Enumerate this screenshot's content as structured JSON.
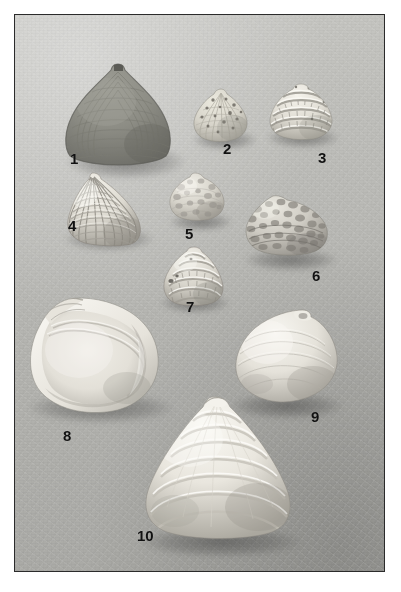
{
  "plate": {
    "kind": "photographic-plate",
    "subject": "bivalve mollusc shells",
    "background_color": "#b8b8b4",
    "frame_color": "#2b2b2b",
    "page_color": "#ffffff",
    "specimen_count": 10,
    "frame": {
      "left": 14,
      "top": 14,
      "width": 371,
      "height": 558
    }
  },
  "specimens": [
    {
      "number": "1",
      "label_x": 69,
      "label_y": 150,
      "x": 61,
      "y": 61,
      "w": 112,
      "h": 104,
      "shape": "trigonal-venerid",
      "tone": "#8f8f88",
      "highlight": "#a8a8a0",
      "shadow_tone": "#6d6d67",
      "sculpture": "concentric-growth-rings",
      "view": "exterior-right-valve"
    },
    {
      "number": "2",
      "label_x": 222,
      "label_y": 140,
      "x": 190,
      "y": 87,
      "w": 59,
      "h": 54,
      "shape": "rounded-trigonal",
      "tone": "#d3d0c8",
      "highlight": "#e8e6df",
      "shadow_tone": "#9d9a92",
      "sculpture": "radial-ribs-with-dark-spots",
      "view": "exterior"
    },
    {
      "number": "3",
      "label_x": 317,
      "label_y": 149,
      "x": 266,
      "y": 82,
      "w": 67,
      "h": 57,
      "shape": "rounded-lamellate",
      "tone": "#dedbd2",
      "highlight": "#f2f0e9",
      "shadow_tone": "#9a978f",
      "sculpture": "strong-concentric-lamellae",
      "view": "exterior"
    },
    {
      "number": "4",
      "label_x": 67,
      "label_y": 217,
      "x": 62,
      "y": 170,
      "w": 82,
      "h": 76,
      "shape": "trigonal-cardiid",
      "tone": "#d8d5cd",
      "highlight": "#efede6",
      "shadow_tone": "#8e8b84",
      "sculpture": "reticulate-cross-hatched-ribs",
      "view": "exterior"
    },
    {
      "number": "5",
      "label_x": 184,
      "label_y": 225,
      "x": 167,
      "y": 171,
      "w": 58,
      "h": 50,
      "shape": "rounded-ovate",
      "tone": "#d5d2ca",
      "highlight": "#eceae3",
      "shadow_tone": "#93908a",
      "sculpture": "mottled-granular",
      "view": "exterior"
    },
    {
      "number": "6",
      "label_x": 311,
      "label_y": 267,
      "x": 242,
      "y": 192,
      "w": 87,
      "h": 64,
      "shape": "elongate-ovate",
      "tone": "#cbc8c0",
      "highlight": "#e6e4dd",
      "shadow_tone": "#85827c",
      "sculpture": "heavily-blotched-mottled",
      "view": "exterior"
    },
    {
      "number": "7",
      "label_x": 185,
      "label_y": 298,
      "x": 160,
      "y": 245,
      "w": 65,
      "h": 61,
      "shape": "conical-trigonal",
      "tone": "#d6d3cb",
      "highlight": "#efede6",
      "shadow_tone": "#8b8882",
      "sculpture": "concentric-beaded-ridges",
      "view": "exterior"
    },
    {
      "number": "8",
      "label_x": 62,
      "label_y": 427,
      "x": 26,
      "y": 295,
      "w": 135,
      "h": 117,
      "shape": "broad-ovate",
      "tone": "#e9e7e0",
      "highlight": "#faf9f5",
      "shadow_tone": "#9a978f",
      "sculpture": "smooth-with-pallial-line",
      "view": "interior-left-valve"
    },
    {
      "number": "9",
      "label_x": 310,
      "label_y": 408,
      "x": 232,
      "y": 307,
      "w": 106,
      "h": 97,
      "shape": "rounded-trigonal",
      "tone": "#e4e2da",
      "highlight": "#f7f6f1",
      "shadow_tone": "#97948d",
      "sculpture": "smooth-prominent-umbo",
      "view": "exterior"
    },
    {
      "number": "10",
      "label_x": 136,
      "label_y": 527,
      "x": 140,
      "y": 394,
      "w": 153,
      "h": 145,
      "shape": "large-trigonal",
      "tone": "#e6e4dc",
      "highlight": "#faf9f4",
      "shadow_tone": "#95928b",
      "sculpture": "broad-concentric-growth-bands",
      "view": "exterior"
    }
  ]
}
